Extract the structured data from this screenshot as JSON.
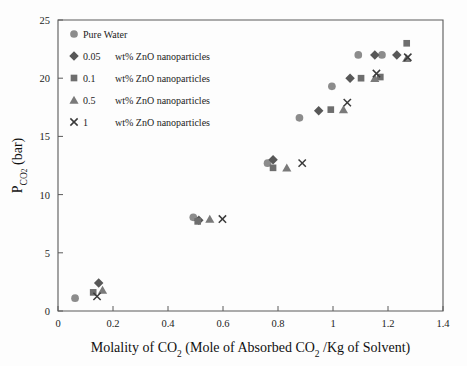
{
  "chart_data": {
    "type": "scatter",
    "title": "",
    "xlabel": "Molality of CO2 (Mole of Absorbed CO2 /Kg of Solvent)",
    "xlabel_parts": {
      "a": "Molality of CO",
      "sub1": "2",
      "b": " (Mole of Absorbed CO",
      "sub2": "2",
      "c": " /Kg of Solvent)"
    },
    "ylabel": "PCO2 (bar)",
    "ylabel_parts": {
      "main": "P",
      "sub": "CO",
      "subsub": "2",
      "unit": " (bar)"
    },
    "xlim": [
      0,
      1.4
    ],
    "ylim": [
      0,
      25
    ],
    "xticks": [
      0,
      0.2,
      0.4,
      0.6,
      0.8,
      1,
      1.2,
      1.4
    ],
    "xticklabels": [
      "0",
      "0.2",
      "0.4",
      "0.6",
      "0.8",
      "1",
      "1.2",
      "1.4"
    ],
    "yticks": [
      0,
      5,
      10,
      15,
      20,
      25
    ],
    "yticklabels": [
      "0",
      "5",
      "10",
      "15",
      "20",
      "25"
    ],
    "grid": false,
    "legend_position": "top-left",
    "marker_color": "#808080",
    "series": [
      {
        "name": "Pure Water",
        "marker": "circle",
        "color": "#8c8c8c",
        "legend_label": "Pure Water",
        "legend_value": "",
        "legend_rest": "Pure Water",
        "points": [
          {
            "x": 0.062,
            "y": 1.1
          },
          {
            "x": 0.492,
            "y": 8.05
          },
          {
            "x": 0.762,
            "y": 12.7
          },
          {
            "x": 0.878,
            "y": 16.6
          },
          {
            "x": 0.996,
            "y": 19.3
          },
          {
            "x": 1.092,
            "y": 22.0
          },
          {
            "x": 1.178,
            "y": 22.0
          }
        ]
      },
      {
        "name": "0.05 wt% ZnO nanoparticles",
        "marker": "diamond",
        "color": "#585858",
        "legend_value": "0.05",
        "legend_rest": "wt% ZnO nanoparticles",
        "points": [
          {
            "x": 0.148,
            "y": 2.4
          },
          {
            "x": 0.512,
            "y": 7.8
          },
          {
            "x": 0.782,
            "y": 13.0
          },
          {
            "x": 0.948,
            "y": 17.2
          },
          {
            "x": 1.062,
            "y": 20.0
          },
          {
            "x": 1.152,
            "y": 22.0
          },
          {
            "x": 1.232,
            "y": 22.0
          }
        ]
      },
      {
        "name": "0.1 wt% ZnO nanoparticles",
        "marker": "square",
        "color": "#6e6e6e",
        "legend_value": "0.1",
        "legend_rest": "wt% ZnO nanoparticles",
        "points": [
          {
            "x": 0.128,
            "y": 1.6
          },
          {
            "x": 0.508,
            "y": 7.7
          },
          {
            "x": 0.782,
            "y": 12.3
          },
          {
            "x": 0.992,
            "y": 17.3
          },
          {
            "x": 1.102,
            "y": 20.0
          },
          {
            "x": 1.172,
            "y": 20.1
          },
          {
            "x": 1.268,
            "y": 23.0
          }
        ]
      },
      {
        "name": "0.5 wt% ZnO nanoparticles",
        "marker": "triangle",
        "color": "#7a7a7a",
        "legend_value": "0.5",
        "legend_rest": "wt% ZnO nanoparticles",
        "points": [
          {
            "x": 0.162,
            "y": 1.8
          },
          {
            "x": 0.552,
            "y": 7.9
          },
          {
            "x": 0.832,
            "y": 12.3
          },
          {
            "x": 1.038,
            "y": 17.3
          },
          {
            "x": 1.152,
            "y": 20.0
          },
          {
            "x": 1.268,
            "y": 21.7
          }
        ]
      },
      {
        "name": "1 wt% ZnO nanoparticles",
        "marker": "x",
        "color": "#3a3a3a",
        "legend_value": "1",
        "legend_rest": "wt% ZnO nanoparticles",
        "points": [
          {
            "x": 0.142,
            "y": 1.25
          },
          {
            "x": 0.598,
            "y": 7.9
          },
          {
            "x": 0.888,
            "y": 12.7
          },
          {
            "x": 1.052,
            "y": 17.9
          },
          {
            "x": 1.158,
            "y": 20.4
          },
          {
            "x": 1.272,
            "y": 21.8
          }
        ]
      }
    ]
  },
  "legend": {
    "items": [
      {
        "marker": "circle",
        "value": "",
        "text": "Pure Water"
      },
      {
        "marker": "diamond",
        "value": "0.05",
        "text": "wt% ZnO nanoparticles"
      },
      {
        "marker": "square",
        "value": "0.1",
        "text": "wt% ZnO nanoparticles"
      },
      {
        "marker": "triangle",
        "value": "0.5",
        "text": "wt% ZnO nanoparticles"
      },
      {
        "marker": "x",
        "value": "1",
        "text": "wt% ZnO nanoparticles"
      }
    ]
  }
}
